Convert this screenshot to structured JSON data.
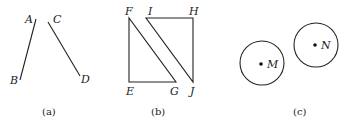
{
  "figure": {
    "panels": [
      {
        "caption": "(a)",
        "segments": [
          {
            "name": "AB",
            "endpoints": [
              "A",
              "B"
            ]
          },
          {
            "name": "CD",
            "endpoints": [
              "C",
              "D"
            ]
          }
        ],
        "points": {
          "A": "A",
          "B": "B",
          "C": "C",
          "D": "D"
        }
      },
      {
        "caption": "(b)",
        "triangles": [
          {
            "name": "EFG",
            "vertices": [
              "E",
              "F",
              "G"
            ]
          },
          {
            "name": "IHJ",
            "vertices": [
              "I",
              "H",
              "J"
            ]
          }
        ],
        "points": {
          "E": "E",
          "F": "F",
          "G": "G",
          "H": "H",
          "I": "I",
          "J": "J"
        }
      },
      {
        "caption": "(c)",
        "circles": [
          {
            "name": "circle-M",
            "center": "M"
          },
          {
            "name": "circle-N",
            "center": "N"
          }
        ],
        "points": {
          "M": "M",
          "N": "N"
        }
      }
    ]
  }
}
